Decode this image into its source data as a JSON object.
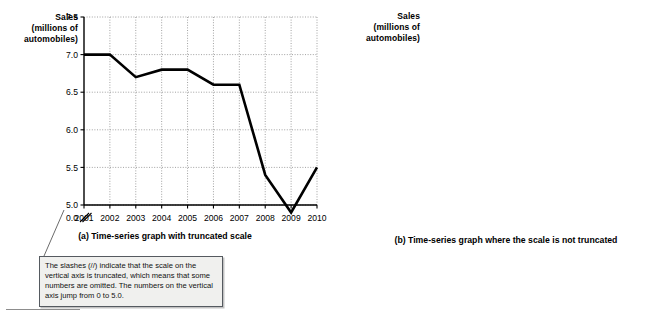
{
  "figure": {
    "bottom_rule": "",
    "callout": {
      "text": "The slashes (//) indicate that the scale on the vertical axis is truncated, which means that some numbers are omitted.  The numbers on the vertical axis jump from 0 to 5.0."
    }
  },
  "panel_a": {
    "axis_title": "Sales\n(millions of\nautomobiles)",
    "axis_title_lines": [
      "Sales",
      "(millions of",
      "automobiles)"
    ],
    "caption": "(a) Time-series graph with truncated scale"
  },
  "panel_b": {
    "axis_title_lines": [
      "Sales",
      "(millions of",
      "automobiles)"
    ],
    "caption": "(b) Time-series graph where the scale is not truncated"
  },
  "chart_data": [
    {
      "id": "panel_a",
      "type": "line",
      "title": "",
      "xlabel": "",
      "ylabel": "Sales (millions of automobiles)",
      "categories": [
        "2001",
        "2002",
        "2003",
        "2004",
        "2005",
        "2006",
        "2007",
        "2008",
        "2009",
        "2010"
      ],
      "x": [
        2001,
        2002,
        2003,
        2004,
        2005,
        2006,
        2007,
        2008,
        2009,
        2010
      ],
      "values": [
        7.0,
        7.0,
        6.7,
        6.8,
        6.8,
        6.6,
        6.6,
        5.4,
        4.9,
        5.5
      ],
      "ylim": [
        5.0,
        7.5
      ],
      "yticks": [
        5.0,
        5.5,
        6.0,
        6.5,
        7.0,
        7.5
      ],
      "ytick_labels": [
        "5.0",
        "5.5",
        "6.0",
        "6.5",
        "7.0",
        "7.5"
      ],
      "axis_break": true,
      "axis_break_label": "0.0",
      "grid": true,
      "legend": "none",
      "line_color": "#000000",
      "grid_color": "#8a8a8a",
      "caption": "(a) Time-series graph with truncated scale"
    },
    {
      "id": "panel_b",
      "type": "line",
      "title": "",
      "xlabel": "",
      "ylabel": "Sales (millions of automobiles)",
      "categories": [
        "2001",
        "2002",
        "2003",
        "2004",
        "2005",
        "2006",
        "2007",
        "2008",
        "2009",
        "2010"
      ],
      "x": [
        2001,
        2002,
        2003,
        2004,
        2005,
        2006,
        2007,
        2008,
        2009,
        2010
      ],
      "values": [
        7.0,
        7.0,
        6.7,
        6.8,
        6.8,
        6.6,
        6.6,
        5.4,
        4.9,
        5.5
      ],
      "ylim": [
        0.0,
        8.0
      ],
      "yticks": [
        0.0,
        1.0,
        2.0,
        3.0,
        4.0,
        5.0,
        6.0,
        7.0,
        8.0
      ],
      "ytick_labels": [
        "0.0",
        "1.0",
        "2.0",
        "3.0",
        "4.0",
        "5.0",
        "6.0",
        "7.0",
        "8.0"
      ],
      "axis_break": false,
      "grid": true,
      "legend": "none",
      "line_color": "#000000",
      "grid_color": "#8a8a8a",
      "caption": "(b) Time-series graph where the scale is not truncated"
    }
  ]
}
